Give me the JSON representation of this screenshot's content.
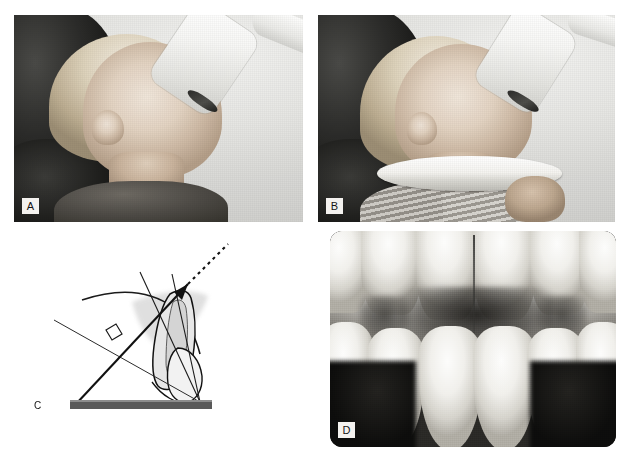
{
  "figure": {
    "kind": "dental-radiography-instructional-plate",
    "background_color": "#ffffff",
    "panel_count": 4
  },
  "panels": [
    {
      "id": "A",
      "label": "A",
      "type": "photograph",
      "caption_text": "",
      "description": "Child seated in profile with the x-ray tube head cone positioned beside the face",
      "label_style": "boxed-light"
    },
    {
      "id": "B",
      "label": "B",
      "type": "photograph",
      "caption_text": "",
      "description": "Same child in profile wearing a round film-holding disc under the chin, hand supporting it",
      "label_style": "boxed-light"
    },
    {
      "id": "C",
      "label": "C",
      "type": "line-diagram",
      "caption_text": "",
      "description": "Schematic of the bisecting-angle technique: tooth long axis, film plane, bisecting line, right-angle marker and central x-ray beam arrow",
      "label_style": "plain-text"
    },
    {
      "id": "D",
      "label": "D",
      "type": "radiograph",
      "caption_text": "",
      "description": "Maxillary anterior periapical radiograph showing incisor crowns and roots",
      "label_style": "boxed-light"
    }
  ],
  "diagram_c": {
    "film_bar": {
      "name": "film-bar",
      "color": "#595959",
      "highlight_color": "#8c8c8c"
    },
    "lines": {
      "long_axis": {
        "name": "tooth-long-axis-line",
        "color": "#1a1a1a",
        "width": 1.1
      },
      "film_plane": {
        "name": "film-plane-line",
        "color": "#2b2b2b",
        "width": 1.0
      },
      "bisecting_line": {
        "name": "bisecting-angle-line",
        "color": "#1a1a1a",
        "width": 1.1
      },
      "central_ray": {
        "name": "central-x-ray-beam",
        "color": "#111111",
        "width": 2.0
      },
      "dashed_extension": {
        "name": "beam-dashed-extension",
        "color": "#111111",
        "dash": "3 3"
      },
      "right_angle_marker": {
        "name": "right-angle-marker",
        "color": "#1a1a1a"
      }
    },
    "tooth": {
      "name": "incisor-cross-section",
      "enamel_fill": "#ffffff",
      "dentin_fill": "#dcdcdc",
      "pulp_fill": "#eaeaea",
      "outline": "#1a1a1a",
      "soft_tissue_shadow": "#b9b9b9"
    }
  },
  "colors": {
    "page_background": "#ffffff",
    "label_background": "#f4f2ef",
    "label_text": "#141414",
    "film_gray": "#595959",
    "photo_light": "#e9e9e6",
    "photo_dark": "#141413"
  }
}
